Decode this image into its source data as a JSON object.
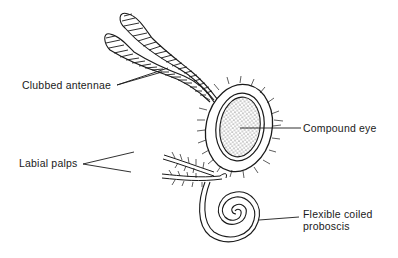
{
  "figure": {
    "background_color": "#ffffff",
    "line_color": "#1a1a1a"
  },
  "labels": {
    "antennae": "Clubbed antennae",
    "eye": "Compound eye",
    "palps": "Labial palps",
    "proboscis_line1": "Flexible coiled",
    "proboscis_line2": "proboscis"
  }
}
